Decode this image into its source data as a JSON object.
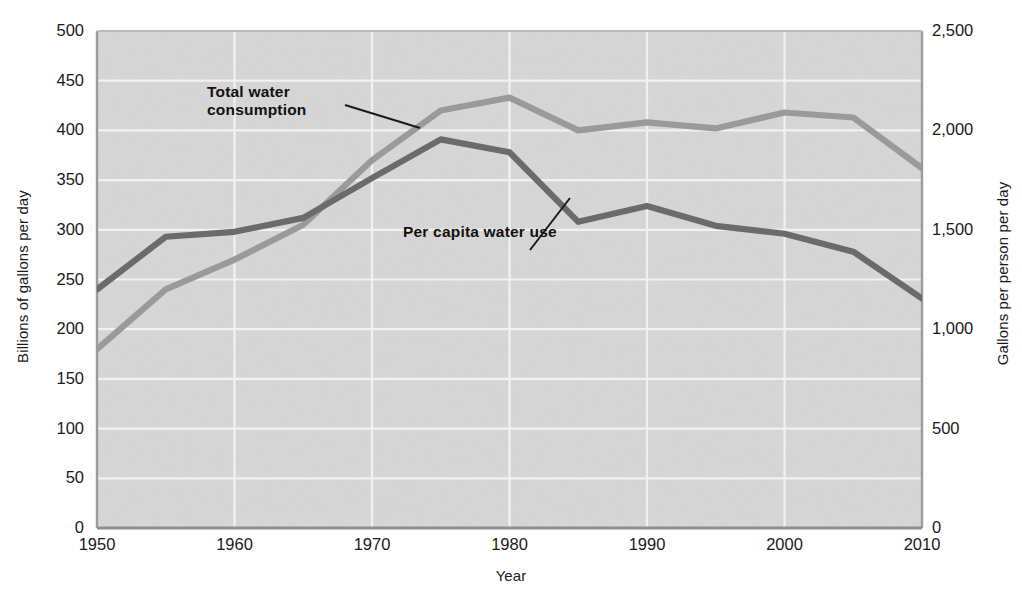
{
  "chart_data": {
    "type": "line",
    "title": "",
    "subtitle": "",
    "xlabel": "Year",
    "ylabel": "Billions of gallons per day",
    "ylabel_right": "Gallons per person per day",
    "x": [
      1950,
      1955,
      1960,
      1965,
      1970,
      1975,
      1980,
      1985,
      1990,
      1995,
      2000,
      2005,
      2010
    ],
    "xlim": [
      1950,
      2010
    ],
    "ylim": [
      0,
      500
    ],
    "ylim_right": [
      0,
      2500
    ],
    "xticks": [
      "1950",
      "1960",
      "1970",
      "1980",
      "1990",
      "2000",
      "2010"
    ],
    "xtick_values": [
      1950,
      1960,
      1970,
      1980,
      1990,
      2000,
      2010
    ],
    "yticks_left": [
      "0",
      "50",
      "100",
      "150",
      "200",
      "250",
      "300",
      "350",
      "400",
      "450",
      "500"
    ],
    "ytick_values_left": [
      0,
      50,
      100,
      150,
      200,
      250,
      300,
      350,
      400,
      450,
      500
    ],
    "yticks_right": [
      "0",
      "500",
      "1,000",
      "1,500",
      "2,000",
      "2,500"
    ],
    "ytick_values_right": [
      0,
      500,
      1000,
      1500,
      2000,
      2500
    ],
    "grid": true,
    "grid_color": "#f0f0f0",
    "plot_background": "#d6d6d6",
    "legend_position": "inline-annotations",
    "series": [
      {
        "name": "Total water consumption",
        "axis": "left",
        "color": "#9a9a9a",
        "unit": "billions of gallons per day",
        "values": [
          180,
          240,
          270,
          305,
          370,
          420,
          433,
          400,
          408,
          402,
          418,
          413,
          362
        ]
      },
      {
        "name": "Per capita water use",
        "axis": "right",
        "color": "#6b6b6b",
        "unit": "gallons per person per day",
        "values": [
          1200,
          1465,
          1490,
          1560,
          1760,
          1955,
          1890,
          1540,
          1620,
          1520,
          1480,
          1390,
          1155
        ]
      }
    ],
    "annotations": [
      {
        "text_line1": "Total water",
        "text_line2": "consumption",
        "target_series": "Total water consumption"
      },
      {
        "text_line1": "Per capita water use",
        "text_line2": "",
        "target_series": "Per capita water use"
      }
    ]
  }
}
